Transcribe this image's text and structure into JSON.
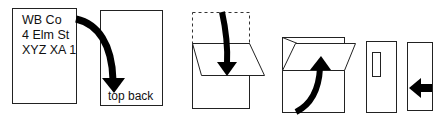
{
  "diagram": {
    "stroke_color": "#222222",
    "arrow_color": "#000000",
    "steps": [
      {
        "id": 1,
        "name": "address-card",
        "address_lines": [
          "WB Co",
          "4 Elm St",
          "XYZ XA 1"
        ]
      },
      {
        "id": 2,
        "name": "flip-to-back",
        "label": "top back"
      },
      {
        "id": 3,
        "name": "fold-top-down"
      },
      {
        "id": 4,
        "name": "fold-bottom-up"
      },
      {
        "id": 5,
        "name": "window-envelope"
      },
      {
        "id": 6,
        "name": "insert-left"
      }
    ]
  }
}
